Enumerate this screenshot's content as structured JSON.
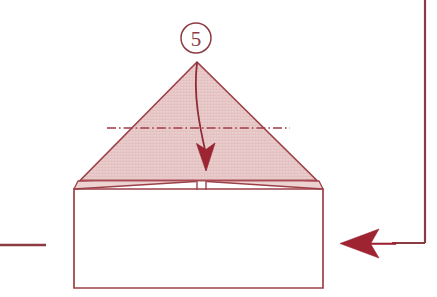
{
  "figure": {
    "step_number": "5",
    "step_badge_shape": "circle"
  },
  "colors": {
    "paper_fill": "#e8c8c8",
    "paper_edge": "#9c4048",
    "fold_line": "#a03c46",
    "arrow_fill": "#9e2432",
    "curved_arrow": "#8e2b36",
    "frame_line": "#8c3b42",
    "background": "#ffffff",
    "back_face_fill": "#ffffff"
  },
  "elements": {
    "step_badge_label": "5",
    "triangle_flap_name": "upper-triangular-flap",
    "fold_line_style": "dash-dot",
    "fold_line_meaning": "valley-fold-crease",
    "curved_arrow_meaning": "fold-downward",
    "side_arrow_meaning": "previous-step-pointer",
    "base_shape_name": "rectangular-base"
  },
  "geometry": {
    "triangle_apex": [
      197,
      62
    ],
    "triangle_left": [
      80,
      181
    ],
    "triangle_right": [
      317,
      181
    ],
    "fold_line_y": 128,
    "fold_line_x1": 107,
    "fold_line_x2": 290,
    "rect_left": 74,
    "rect_right": 323,
    "rect_top": 189,
    "rect_bottom": 288,
    "badge_center": [
      196,
      38
    ],
    "badge_radius": 15,
    "curve_start": [
      197,
      63
    ],
    "curve_end": [
      206,
      166
    ],
    "side_arrow_tip": [
      340,
      243
    ],
    "frame_vertical_x": 425,
    "frame_left_stub_y": 245,
    "frame_left_stub_x_end": 46
  },
  "annotations": {
    "none": ""
  }
}
